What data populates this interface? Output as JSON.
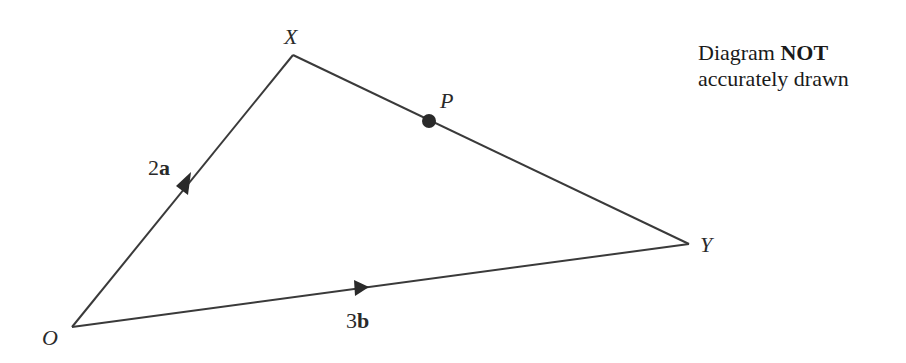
{
  "diagram": {
    "type": "vector-triangle",
    "points": {
      "O": {
        "label": "O",
        "x": 72,
        "y": 327
      },
      "X": {
        "label": "X",
        "x": 293,
        "y": 55
      },
      "Y": {
        "label": "Y",
        "x": 689,
        "y": 244
      },
      "P": {
        "label": "P",
        "x": 429,
        "y": 121
      }
    },
    "vectors": {
      "OX": {
        "label_num": "2",
        "label_vec": "a"
      },
      "OY": {
        "label_num": "3",
        "label_vec": "b"
      }
    },
    "note": {
      "line1_prefix": "Diagram ",
      "line1_bold": "NOT",
      "line2": "accurately drawn"
    },
    "colors": {
      "line": "#3a3a3a",
      "point": "#2a2a2a"
    }
  }
}
